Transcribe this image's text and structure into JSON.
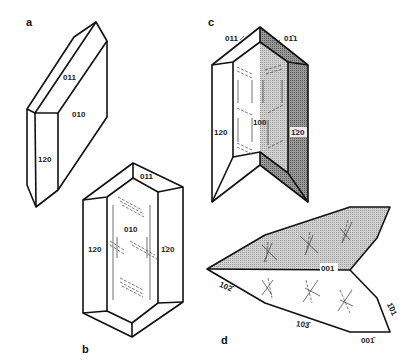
{
  "figure": {
    "panels": [
      {
        "id": "a",
        "label": "a",
        "faces": {
          "top": "011",
          "front": "010",
          "side": "120"
        }
      },
      {
        "id": "b",
        "label": "b",
        "faces": {
          "top": "011",
          "front": "010",
          "left": "120",
          "right": "1̄20"
        }
      },
      {
        "id": "c",
        "label": "c",
        "faces": {
          "top_left": "011",
          "top_right": "01̄1",
          "center": "100",
          "left": "120",
          "right": "1̄20"
        }
      },
      {
        "id": "d",
        "label": "d",
        "faces": {
          "top": "001",
          "lower_left": "102̄",
          "lower_mid": "103̄",
          "right": "1̄01",
          "bottom_right": "001̄"
        }
      }
    ]
  },
  "colors": {
    "line": "#111111",
    "shade_light": "#c8c8c8",
    "shade_dark": "#8a8a8a",
    "background": "#ffffff"
  }
}
